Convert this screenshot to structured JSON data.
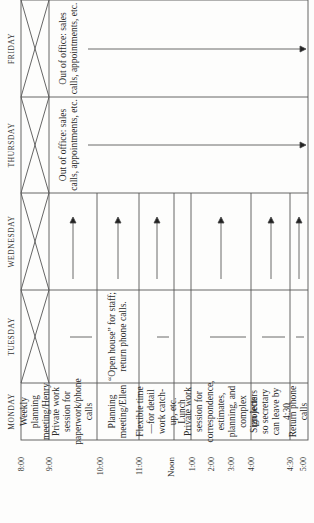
{
  "schedule": {
    "days": [
      "MONDAY",
      "TUESDAY",
      "WEDNESDAY",
      "THURSDAY",
      "FRIDAY"
    ],
    "times": [
      {
        "label": "8:00"
      },
      {
        "label": "9:00"
      },
      {
        "label": "10:00"
      },
      {
        "label": "11:00"
      },
      {
        "label": "Noon"
      },
      {
        "label": "1:00"
      },
      {
        "label": "2:00"
      },
      {
        "label": "3:00"
      },
      {
        "label": "4:00"
      },
      {
        "label": "4:30"
      },
      {
        "label": "5:00"
      }
    ],
    "monday": [
      "Weekly planning meeting/Henry",
      "Private work session for paperwork/phone calls",
      "Planning meeting/Ellen",
      "Flexible time—for detail work catch-up, etc.",
      "Lunch",
      "Private work session for correspondence, estimates, planning, and complex projects",
      "Sign letters so secretary can leave by 4:30",
      "Return phone calls"
    ],
    "tuesday": {
      "open_house": "“Open house” for staff; return phone calls."
    },
    "thursday": {
      "out_of_office": "Out of office: sales calls, appointments, etc."
    },
    "friday": {
      "out_of_office": "Out of office: sales calls, appointments, etc."
    }
  }
}
